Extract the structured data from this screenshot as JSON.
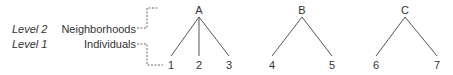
{
  "levels": [
    {
      "level_label": "Level 2",
      "unit_label": "Neighborhoods"
    },
    {
      "level_label": "Level 1",
      "unit_label": "Individuals"
    }
  ],
  "groups": [
    {
      "label": "A",
      "members": [
        "1",
        "2",
        "3"
      ]
    },
    {
      "label": "B",
      "members": [
        "4",
        "5"
      ]
    },
    {
      "label": "C",
      "members": [
        "6",
        "7"
      ]
    }
  ]
}
